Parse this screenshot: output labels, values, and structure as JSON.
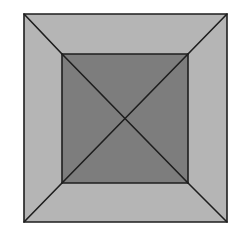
{
  "diagram": {
    "type": "square-frustum-top-view",
    "colors": {
      "background": "#ffffff",
      "outer_band": "#b5b5b5",
      "inner_square": "#7d7d7d",
      "stroke": "#1e1e1e"
    },
    "outer_square": {
      "x1": 24,
      "y1": 14,
      "x2": 227,
      "y2": 222
    },
    "inner_square": {
      "x1": 62,
      "y1": 54,
      "x2": 188,
      "y2": 183
    },
    "center": {
      "x": 125,
      "y": 118
    }
  }
}
